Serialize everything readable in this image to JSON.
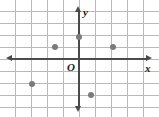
{
  "figure": {
    "type": "coordinate-plane",
    "width": 159,
    "height": 117,
    "origin_label": "O",
    "x_axis_label": "x",
    "y_axis_label": "y",
    "colors": {
      "axis": "#4a4a4a",
      "grid": "#b9b9b9",
      "point": "#7b7b7b",
      "background": "#ffffff",
      "label": "#1a1a1a"
    }
  },
  "chart_data": {
    "type": "scatter",
    "title": "",
    "xlabel": "x",
    "ylabel": "y",
    "grid": true,
    "legend": "none",
    "xlim": [
      -5,
      5
    ],
    "ylim": [
      -5,
      4
    ],
    "grid_spacing_x": 1,
    "grid_spacing_y": 1,
    "points": [
      {
        "x": -1.5,
        "y": 1
      },
      {
        "x": 0,
        "y": 2
      },
      {
        "x": 2,
        "y": 1
      },
      {
        "x": -3,
        "y": -2
      },
      {
        "x": 0.75,
        "y": -3
      }
    ],
    "pixel_points": [
      {
        "px": 55,
        "py": 47
      },
      {
        "px": 79,
        "py": 37
      },
      {
        "px": 113,
        "py": 47
      },
      {
        "px": 32,
        "py": 84
      },
      {
        "px": 91,
        "py": 95
      }
    ],
    "origin_pixel": {
      "px": 79,
      "py": 59
    },
    "grid_lines_vertical_px": [
      15,
      31,
      47,
      63,
      79,
      95,
      111,
      127,
      143
    ],
    "grid_lines_horizontal_px": [
      11,
      23,
      35,
      47,
      59,
      71,
      83,
      95,
      107
    ]
  }
}
